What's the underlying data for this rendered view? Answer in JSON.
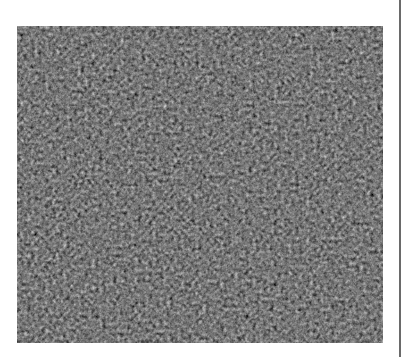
{
  "figure": {
    "caption_fragment": "",
    "colors": {
      "background": "#ffffff",
      "texture_base": "#262626",
      "right_rule": "#6a6a6a"
    }
  }
}
